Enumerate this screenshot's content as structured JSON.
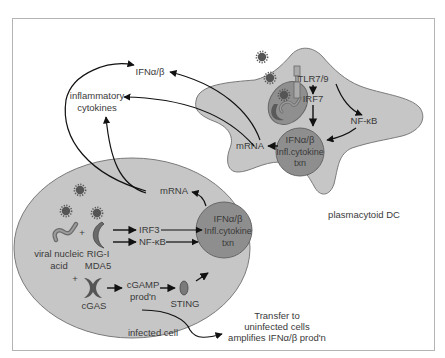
{
  "colors": {
    "background": "#ffffff",
    "frame": "#b4b4b4",
    "cell_fill": "#c6c6c6",
    "cell_stroke": "#7a7a7a",
    "nucleus_fill": "#8e8e8e",
    "endosome_fill": "#8a8a8a",
    "virus_fill": "#555555",
    "arrow": "#111111",
    "text": "#3a3a3a"
  },
  "outside": {
    "ifn_label": "IFNα/β",
    "cytokines_label_line1": "inflammatory",
    "cytokines_label_line2": "cytokines",
    "transfer_line1": "Transfer to",
    "transfer_line2": "uninfected cells",
    "transfer_line3": "amplifies IFNα/β prod'n"
  },
  "pdc": {
    "name": "plasmacytoid DC",
    "receptor": "TLR7/9",
    "irf": "IRF7",
    "nfkb": "NF-κB",
    "mrna": "mRNA",
    "nucleus_line1": "IFNα/β",
    "nucleus_line2": "Infl.cytokine",
    "nucleus_line3": "txn"
  },
  "infected_cell": {
    "name": "infected cell",
    "mrna": "mRNA",
    "viral_line1": "viral nucleic",
    "viral_line2": "acid",
    "plus1": "+",
    "plus2": "+",
    "rig_line1": "RIG-I",
    "rig_line2": "MDA5",
    "irf": "IRF3",
    "nfkb": "NF-κB",
    "cgas": "cGAS",
    "cgamp_line1": "cGAMP",
    "cgamp_line2": "prod'n",
    "sting": "STING",
    "nucleus_line1": "IFNα/β",
    "nucleus_line2": "Infl.cytokine",
    "nucleus_line3": "txn"
  }
}
